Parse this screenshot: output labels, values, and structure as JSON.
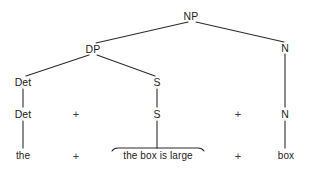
{
  "figure": {
    "type": "constituency-tree",
    "background_color": "#ffffff",
    "line_color": "#2b2b2b",
    "text_color": "#1d1d1d"
  },
  "nodes": [
    {
      "id": "np",
      "label": "NP",
      "x": 191,
      "y": 16,
      "kind": "nonterminal"
    },
    {
      "id": "dp",
      "label": "DP",
      "x": 93,
      "y": 49,
      "kind": "nonterminal"
    },
    {
      "id": "n_upper",
      "label": "N",
      "x": 285,
      "y": 48,
      "kind": "nonterminal"
    },
    {
      "id": "det_upper",
      "label": "Det",
      "x": 23,
      "y": 82,
      "kind": "nonterminal"
    },
    {
      "id": "s_upper",
      "label": "S",
      "x": 157,
      "y": 82,
      "kind": "nonterminal"
    },
    {
      "id": "det_lower",
      "label": "Det",
      "x": 23,
      "y": 114,
      "kind": "nonterminal"
    },
    {
      "id": "s_lower",
      "label": "S",
      "x": 157,
      "y": 114,
      "kind": "nonterminal"
    },
    {
      "id": "n_lower",
      "label": "N",
      "x": 285,
      "y": 114,
      "kind": "nonterminal"
    },
    {
      "id": "plus_1",
      "label": "+",
      "x": 76,
      "y": 114,
      "kind": "operator"
    },
    {
      "id": "plus_2",
      "label": "+",
      "x": 238,
      "y": 114,
      "kind": "operator"
    },
    {
      "id": "the",
      "label": "the",
      "x": 23,
      "y": 156,
      "kind": "terminal"
    },
    {
      "id": "plus_3",
      "label": "+",
      "x": 76,
      "y": 156,
      "kind": "operator"
    },
    {
      "id": "clause",
      "label": "the box is large",
      "x": 158,
      "y": 156,
      "kind": "terminal-phrase"
    },
    {
      "id": "plus_4",
      "label": "+",
      "x": 238,
      "y": 156,
      "kind": "operator"
    },
    {
      "id": "box",
      "label": "box",
      "x": 286,
      "y": 156,
      "kind": "terminal"
    }
  ],
  "edges": [
    {
      "from": "np",
      "to": "dp",
      "x1": 188,
      "y1": 22,
      "x2": 96,
      "y2": 43
    },
    {
      "from": "np",
      "to": "n_upper",
      "x1": 196,
      "y1": 22,
      "x2": 284,
      "y2": 42
    },
    {
      "from": "dp",
      "to": "det_upper",
      "x1": 89,
      "y1": 55,
      "x2": 26,
      "y2": 76
    },
    {
      "from": "dp",
      "to": "s_upper",
      "x1": 97,
      "y1": 55,
      "x2": 155,
      "y2": 76
    },
    {
      "from": "det_upper",
      "to": "det_lower",
      "x1": 23,
      "y1": 89,
      "x2": 23,
      "y2": 107
    },
    {
      "from": "s_upper",
      "to": "s_lower",
      "x1": 157,
      "y1": 89,
      "x2": 157,
      "y2": 107
    },
    {
      "from": "n_upper",
      "to": "n_lower",
      "x1": 285,
      "y1": 54,
      "x2": 285,
      "y2": 107
    },
    {
      "from": "det_lower",
      "to": "the",
      "x1": 23,
      "y1": 121,
      "x2": 23,
      "y2": 148
    },
    {
      "from": "s_lower",
      "to": "clause",
      "x1": 157,
      "y1": 121,
      "x2": 157,
      "y2": 148
    },
    {
      "from": "n_lower",
      "to": "box",
      "x1": 285,
      "y1": 121,
      "x2": 285,
      "y2": 148
    }
  ],
  "bracket": {
    "label": "clause-overline-bracket",
    "left_x": 112,
    "right_x": 204,
    "y": 148,
    "tip_drop": 3
  }
}
